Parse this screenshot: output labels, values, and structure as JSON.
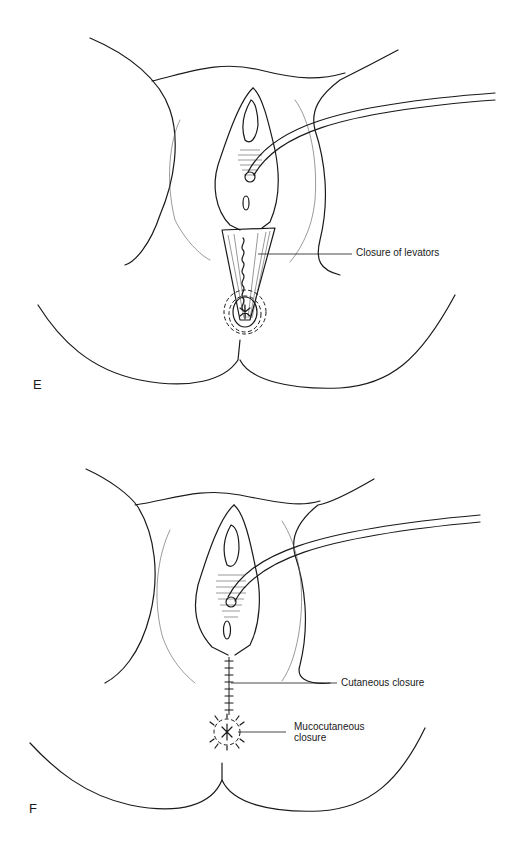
{
  "figure": {
    "panels": [
      {
        "id": "E",
        "letter": "E",
        "callouts": [
          {
            "label": "Closure of levators"
          }
        ]
      },
      {
        "id": "F",
        "letter": "F",
        "callouts": [
          {
            "label": "Cutaneous closure"
          },
          {
            "label": "Mucocutaneous closure",
            "line1": "Mucocutaneous",
            "line2": "closure"
          }
        ]
      }
    ],
    "colors": {
      "line": "#1a1a1a",
      "background": "#ffffff"
    }
  }
}
